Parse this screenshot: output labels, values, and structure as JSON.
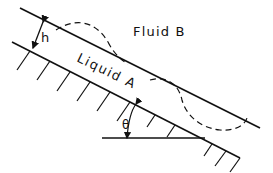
{
  "diagram": {
    "labels": {
      "fluid_b": "Fluid B",
      "liquid_a": "Liquid A",
      "thickness": "h",
      "angle": "θ"
    },
    "colors": {
      "line": "#111111",
      "background": "#ffffff"
    }
  }
}
